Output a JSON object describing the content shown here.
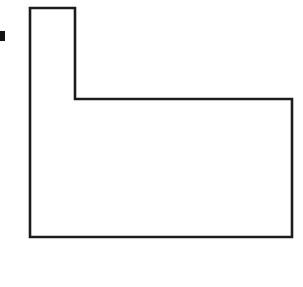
{
  "figure": {
    "type": "line-drawing",
    "background_color": "#ffffff",
    "stroke_color": "#1c1c1c",
    "fill_color": "#ffffff",
    "stroke_width_px": 2.6,
    "caption": "Scanned black-and-white outline drawing of an L-shaped hexagonal region with a small solid tick mark at the left margin.",
    "shape": {
      "name": "l-shape",
      "sides": 6,
      "vertices": [
        {
          "label": "top-left",
          "x": 30,
          "y": 8
        },
        {
          "label": "top-right-of-column",
          "x": 75,
          "y": 8
        },
        {
          "label": "inner-notch-corner",
          "x": 75,
          "y": 99
        },
        {
          "label": "top-right",
          "x": 292,
          "y": 99
        },
        {
          "label": "bottom-right",
          "x": 292,
          "y": 237
        },
        {
          "label": "bottom-left",
          "x": 30,
          "y": 237
        }
      ],
      "points_attribute": "30,8 75,8 75,99 292,99 292,237 30,237",
      "dimensions": {
        "overall_width_px": 262,
        "overall_height_px": 229,
        "column_width_px": 45,
        "column_height_px": 91,
        "base_height_px": 138
      }
    },
    "marks": [
      {
        "name": "edge-tick",
        "shape": "rectangle",
        "x": 0,
        "y": 31,
        "width": 5,
        "height": 10,
        "color": "#141414"
      }
    ]
  }
}
